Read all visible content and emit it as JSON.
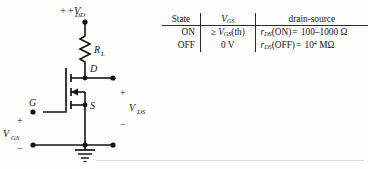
{
  "figure": {
    "circuit": {
      "supply_label": "+V",
      "supply_sub": "DD",
      "resistor_label": "R",
      "resistor_sub": "L",
      "drain_label": "D",
      "source_label": "S",
      "gate_label": "G",
      "input_label": "V",
      "input_sub": "GS",
      "output_label": "V",
      "output_sub": "DS",
      "input_plus": "+",
      "input_minus": "−",
      "output_plus": "+",
      "output_minus": "−"
    },
    "table": {
      "headers": {
        "state": "State",
        "vgs": "V",
        "vgs_sub": "GS",
        "drain_source": "drain-source"
      },
      "rows": [
        {
          "state": "ON",
          "vgs_prefix": "≥",
          "vgs_sym": "V",
          "vgs_sub": "GS",
          "vgs_suffix": "(th)",
          "ds_sym": "r",
          "ds_sub": "DS",
          "ds_cond": "(ON)",
          "ds_eq": "=",
          "ds_value": "100–1000",
          "ds_unit": "Ω"
        },
        {
          "state": "OFF",
          "vgs_prefix": "",
          "vgs_sym": "",
          "vgs_sub": "",
          "vgs_suffix": "0 V",
          "ds_sym": "r",
          "ds_sub": "DS",
          "ds_cond": "(OFF)",
          "ds_eq": "=",
          "ds_value": "10",
          "ds_exp": "4",
          "ds_unit": "MΩ"
        }
      ]
    },
    "colors": {
      "ink": "#141414",
      "rule": "#2a2a2a",
      "page": "#fdfdfc"
    }
  }
}
